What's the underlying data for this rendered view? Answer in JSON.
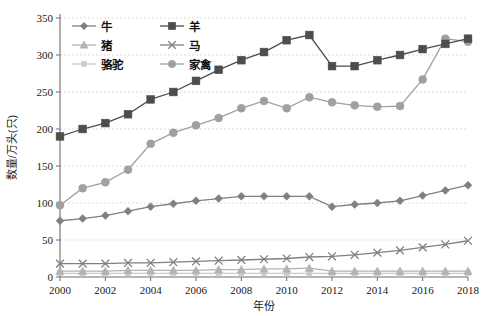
{
  "chart_data": {
    "type": "line",
    "title": "",
    "xlabel": "年份",
    "ylabel": "数量/万头(只)",
    "xlim": [
      2000,
      2018
    ],
    "ylim": [
      0,
      350
    ],
    "ytick_step": 50,
    "xtick_step": 2,
    "grid": true,
    "legend_position": "top-left",
    "x": [
      2000,
      2001,
      2002,
      2003,
      2004,
      2005,
      2006,
      2007,
      2008,
      2009,
      2010,
      2011,
      2012,
      2013,
      2014,
      2015,
      2016,
      2017,
      2018
    ],
    "xtick_labels": [
      "2000",
      "2002",
      "2004",
      "2006",
      "2008",
      "2010",
      "2012",
      "2014",
      "2016",
      "2018"
    ],
    "ytick_labels": [
      "0",
      "50",
      "100",
      "150",
      "200",
      "250",
      "300",
      "350"
    ],
    "series": [
      {
        "name": "牛",
        "marker": "diamond",
        "color": "#808080",
        "values": [
          76,
          79,
          83,
          89,
          95,
          99,
          103,
          106,
          109,
          109,
          109,
          109,
          95,
          98,
          100,
          103,
          110,
          117,
          124
        ]
      },
      {
        "name": "羊",
        "marker": "square",
        "color": "#4d4d4d",
        "values": [
          190,
          200,
          208,
          220,
          240,
          250,
          265,
          280,
          293,
          304,
          320,
          327,
          285,
          285,
          293,
          300,
          308,
          315,
          322
        ]
      },
      {
        "name": "猪",
        "marker": "triangle",
        "color": "#b3b3b3",
        "values": [
          8,
          8,
          8,
          9,
          9,
          9,
          9,
          10,
          10,
          11,
          11,
          12,
          8,
          8,
          8,
          8,
          8,
          8,
          8
        ]
      },
      {
        "name": "马",
        "marker": "x",
        "color": "#808080",
        "values": [
          18,
          18,
          18,
          19,
          19,
          20,
          21,
          22,
          23,
          24,
          25,
          27,
          28,
          30,
          33,
          36,
          40,
          44,
          49
        ]
      },
      {
        "name": "骆驼",
        "marker": "small-square",
        "color": "#cccccc",
        "values": [
          5,
          5,
          5,
          5,
          5,
          5,
          5,
          5,
          5,
          5,
          5,
          5,
          5,
          5,
          5,
          5,
          5,
          5,
          5
        ]
      },
      {
        "name": "家禽",
        "marker": "circle",
        "color": "#a0a0a0",
        "values": [
          97,
          120,
          128,
          145,
          180,
          195,
          205,
          215,
          228,
          238,
          228,
          243,
          236,
          232,
          230,
          231,
          267,
          322,
          318
        ]
      }
    ]
  },
  "axes": {
    "y_axis_title": "数量/万头(只)",
    "x_axis_title": "年份"
  }
}
